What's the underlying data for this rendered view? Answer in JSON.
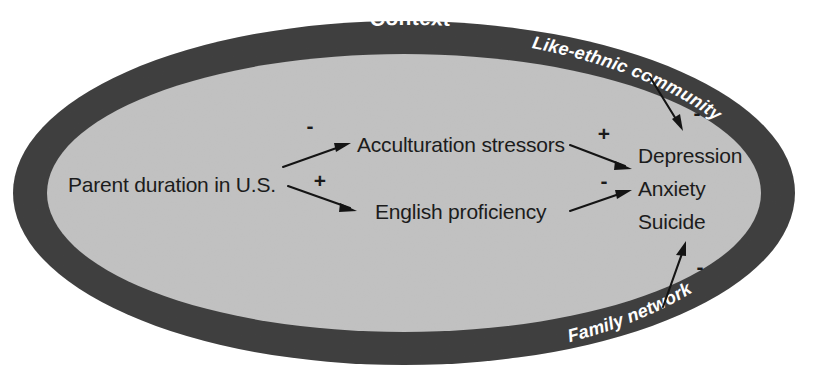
{
  "figure": {
    "type": "conceptual-path-diagram",
    "shape": "ellipse",
    "colors": {
      "band": "#3a3a3a",
      "interior": "#c6c6c6",
      "page_background": "#ffffff",
      "text": "#1c1c1c",
      "band_text": "#ffffff",
      "arrow": "#141414"
    }
  },
  "container": {
    "band_title": "Context",
    "band_labels": [
      {
        "id": "like-ethnic-community",
        "text": "Like-ethnic community",
        "position": "upper-right"
      },
      {
        "id": "family-network",
        "text": "Family network",
        "position": "lower-right"
      }
    ]
  },
  "nodes": [
    {
      "id": "parent-duration",
      "label": "Parent duration in U.S."
    },
    {
      "id": "acculturation-stressors",
      "label": "Acculturation stressors"
    },
    {
      "id": "english-proficiency",
      "label": "English proficiency"
    },
    {
      "id": "outcomes",
      "label_lines": [
        "Depression",
        "Anxiety",
        "Suicide"
      ]
    }
  ],
  "outcomes": {
    "line1": "Depression",
    "line2": "Anxiety",
    "line3": "Suicide"
  },
  "edges": [
    {
      "id": "duration-to-stressors",
      "from": "parent-duration",
      "to": "acculturation-stressors",
      "sign": "-"
    },
    {
      "id": "duration-to-english",
      "from": "parent-duration",
      "to": "english-proficiency",
      "sign": "+"
    },
    {
      "id": "stressors-to-outcomes",
      "from": "acculturation-stressors",
      "to": "outcomes",
      "sign": "+"
    },
    {
      "id": "english-to-outcomes",
      "from": "english-proficiency",
      "to": "outcomes",
      "sign": "-"
    },
    {
      "id": "community-to-outcomes",
      "from": "like-ethnic-community",
      "to": "outcomes",
      "sign": "-"
    },
    {
      "id": "family-to-outcomes",
      "from": "family-network",
      "to": "outcomes",
      "sign": "-"
    }
  ]
}
